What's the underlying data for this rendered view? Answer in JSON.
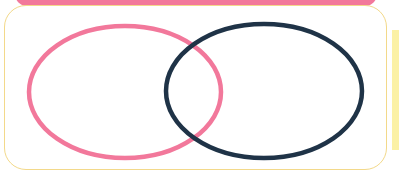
{
  "diagram": {
    "type": "venn",
    "sets": [
      {
        "name": "set-a",
        "label": "",
        "color": "#f2789b",
        "cx": 125,
        "cy": 92,
        "rx": 96,
        "ry": 66
      },
      {
        "name": "set-b",
        "label": "",
        "color": "#1f3347",
        "cx": 264,
        "cy": 91,
        "rx": 98,
        "ry": 67
      }
    ],
    "colors": {
      "header_bar": "#f2789b",
      "panel_border": "#f3d98a",
      "side_strip": "#fbf1a6",
      "background": "#ffffff"
    }
  }
}
